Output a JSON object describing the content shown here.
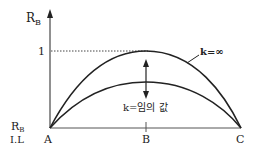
{
  "diagram": {
    "type": "influence-line",
    "colors": {
      "line": "#222222",
      "dotted": "#444444",
      "background": "#ffffff"
    },
    "y_axis_label": {
      "main": "R",
      "sub": "B"
    },
    "y_tick_label": "1",
    "bottom_left_label": {
      "line1_main": "R",
      "line1_sub": "B",
      "line2": "I.L"
    },
    "points": [
      {
        "id": "A",
        "label": "A"
      },
      {
        "id": "B",
        "label": "B"
      },
      {
        "id": "C",
        "label": "C"
      }
    ],
    "curves": [
      {
        "id": "k-infinity",
        "label": "k=∞",
        "peak_value": 1
      },
      {
        "id": "k-arbitrary",
        "label": "k=임의 값",
        "peak_value": 0.6
      }
    ]
  }
}
